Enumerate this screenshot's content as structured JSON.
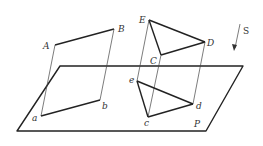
{
  "diagram": {
    "plane_label": "P",
    "direction_label": "S",
    "quadrilateral_upper": {
      "labels": [
        "A",
        "B"
      ]
    },
    "quadrilateral_lower": {
      "labels": [
        "a",
        "b"
      ]
    },
    "triangle_upper": {
      "labels": [
        "E",
        "C",
        "D"
      ]
    },
    "triangle_lower": {
      "labels": [
        "e",
        "c",
        "d"
      ]
    },
    "colors": {
      "stroke": "#222222",
      "text": "#333333",
      "background": "#ffffff"
    }
  }
}
